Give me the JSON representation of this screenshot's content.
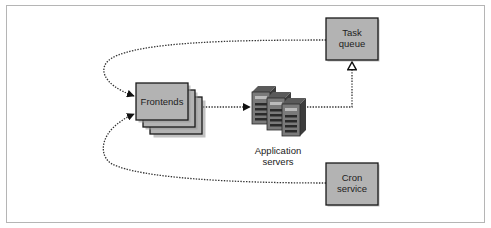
{
  "diagram": {
    "nodes": {
      "frontends": {
        "label": "Frontends"
      },
      "app_servers": {
        "label_line1": "Application",
        "label_line2": "servers"
      },
      "task_queue": {
        "label_line1": "Task",
        "label_line2": "queue"
      },
      "cron_service": {
        "label_line1": "Cron",
        "label_line2": "service"
      }
    },
    "edges": [
      {
        "from": "frontends",
        "to": "app_servers",
        "style": "dotted",
        "arrow": "filled"
      },
      {
        "from": "app_servers",
        "to": "task_queue",
        "style": "dotted",
        "arrow": "hollow"
      },
      {
        "from": "task_queue",
        "to": "frontends",
        "style": "dotted",
        "arrow": "filled"
      },
      {
        "from": "cron_service",
        "to": "frontends",
        "style": "dotted",
        "arrow": "filled"
      }
    ],
    "colors": {
      "box_fill": "#b3b3b3",
      "box_border": "#1a1a1a",
      "shadow": "#9a9a9a",
      "frame": "#b5b5b5",
      "server_body": "#7a7a7a",
      "server_dark": "#3c3c3c"
    }
  }
}
